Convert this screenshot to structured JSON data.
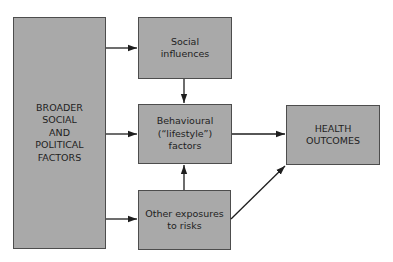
{
  "diagram": {
    "colors": {
      "box_fill": "#a9a9a9",
      "box_border": "#4d4d4d",
      "arrow": "#1e1e1e",
      "text": "#1e1e1e"
    },
    "nodes": [
      {
        "id": "broader",
        "label": "BROADER\nSOCIAL\nAND\nPOLITICAL\nFACTORS"
      },
      {
        "id": "social",
        "label": "Social\ninfluences"
      },
      {
        "id": "behavioural",
        "label": "Behavioural\n(“lifestyle”)\nfactors"
      },
      {
        "id": "other",
        "label": "Other exposures\nto risks"
      },
      {
        "id": "health",
        "label": "HEALTH\nOUTCOMES"
      }
    ],
    "edges": [
      {
        "from": "broader",
        "to": "social"
      },
      {
        "from": "broader",
        "to": "behavioural"
      },
      {
        "from": "broader",
        "to": "other"
      },
      {
        "from": "social",
        "to": "behavioural"
      },
      {
        "from": "other",
        "to": "behavioural"
      },
      {
        "from": "behavioural",
        "to": "health"
      },
      {
        "from": "other",
        "to": "health"
      }
    ]
  }
}
